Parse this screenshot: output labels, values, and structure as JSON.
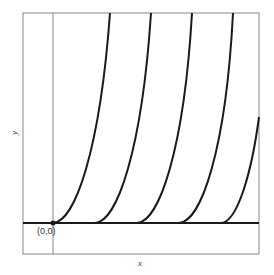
{
  "diagram": {
    "type": "family of curves",
    "xlabel": "x",
    "ylabel": "y",
    "origin_label": "(0,0)",
    "curve_count": 5,
    "curve_start_x_px": [
      53,
      95,
      137,
      179,
      221
    ],
    "colors": {
      "curve": "#1a1a1a",
      "frame": "#888888",
      "axis": "#1a1a1a"
    }
  }
}
